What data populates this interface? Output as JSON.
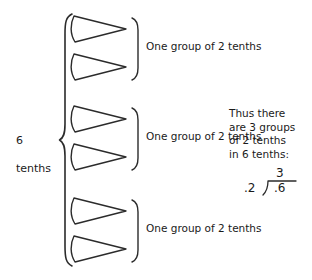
{
  "canvas": {
    "width": 312,
    "height": 280,
    "background": "#ffffff",
    "ink": "#1a1a1a"
  },
  "diagram": {
    "title_text": "Dividing 6 tenths by 2 tenths",
    "total_label": "6\ntenths",
    "total_label_line1": "6",
    "total_label_line2": "tenths",
    "brace_name": "left-curly-brace",
    "groups": [
      {
        "label": "One group of 2 tenths",
        "shape_count": 2,
        "shape_name": "triangle-right"
      },
      {
        "label": "One group of 2 tenths",
        "shape_count": 2,
        "shape_name": "triangle-right"
      },
      {
        "label": "One group of 2 tenths",
        "shape_count": 2,
        "shape_name": "triangle-right"
      }
    ]
  },
  "explanation": {
    "lines": [
      "Thus there",
      "are 3 groups",
      "of 2 tenths",
      "in 6 tenths:"
    ],
    "line0": "Thus there",
    "line1": "are 3 groups",
    "line2": "of 2 tenths",
    "line3": "in 6 tenths:"
  },
  "division": {
    "quotient": "3",
    "divisor": ".2",
    "dividend": ".6",
    "bracket_name": "long-division-bracket"
  }
}
